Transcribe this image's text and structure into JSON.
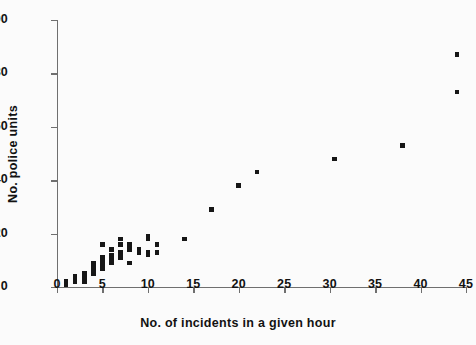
{
  "chart_data": {
    "type": "scatter",
    "title": "",
    "xlabel": "No. of incidents in a given hour",
    "ylabel": "No. police units",
    "xlim": [
      0,
      45
    ],
    "ylim": [
      0,
      100
    ],
    "xticks": [
      0,
      5,
      10,
      15,
      20,
      25,
      30,
      35,
      40,
      45
    ],
    "yticks": [
      0,
      20,
      40,
      60,
      80,
      100
    ],
    "grid": false,
    "legend": null,
    "marker": "square",
    "marker_color": "#161616",
    "axis_color": "#6f6f6f",
    "background_color": "#fbfbfb",
    "points": [
      [
        1,
        1
      ],
      [
        1,
        2
      ],
      [
        2,
        2
      ],
      [
        2,
        3
      ],
      [
        2,
        4
      ],
      [
        3,
        2
      ],
      [
        3,
        3
      ],
      [
        3,
        4
      ],
      [
        3,
        5
      ],
      [
        4,
        5
      ],
      [
        4,
        6
      ],
      [
        4,
        7
      ],
      [
        4,
        8
      ],
      [
        4,
        9
      ],
      [
        5,
        7
      ],
      [
        5,
        8
      ],
      [
        5,
        9
      ],
      [
        5,
        10
      ],
      [
        5,
        11
      ],
      [
        5,
        16
      ],
      [
        6,
        9
      ],
      [
        6,
        10
      ],
      [
        6,
        11
      ],
      [
        6,
        12
      ],
      [
        6,
        14
      ],
      [
        7,
        11
      ],
      [
        7,
        12
      ],
      [
        7,
        13
      ],
      [
        7,
        18
      ],
      [
        7,
        16
      ],
      [
        8,
        9
      ],
      [
        8,
        14
      ],
      [
        8,
        15
      ],
      [
        8,
        16
      ],
      [
        9,
        13
      ],
      [
        9,
        14
      ],
      [
        10,
        12
      ],
      [
        10,
        13
      ],
      [
        10,
        18
      ],
      [
        10,
        19
      ],
      [
        11,
        13
      ],
      [
        11,
        16
      ],
      [
        14,
        18
      ],
      [
        17,
        29
      ],
      [
        20,
        38
      ],
      [
        22,
        43
      ],
      [
        30.5,
        48
      ],
      [
        38,
        53
      ],
      [
        44,
        87
      ],
      [
        44,
        73
      ]
    ]
  }
}
